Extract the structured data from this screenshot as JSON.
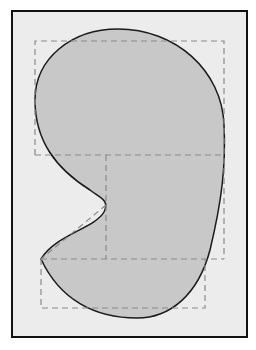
{
  "figure": {
    "colors": {
      "page_background": "#ffffff",
      "frame_fill": "#ececec",
      "frame_stroke": "#111111",
      "blob_fill": "#c8c8c8",
      "blob_stroke": "#1a1a1a",
      "dashed_stroke": "#8a8a8a"
    }
  }
}
